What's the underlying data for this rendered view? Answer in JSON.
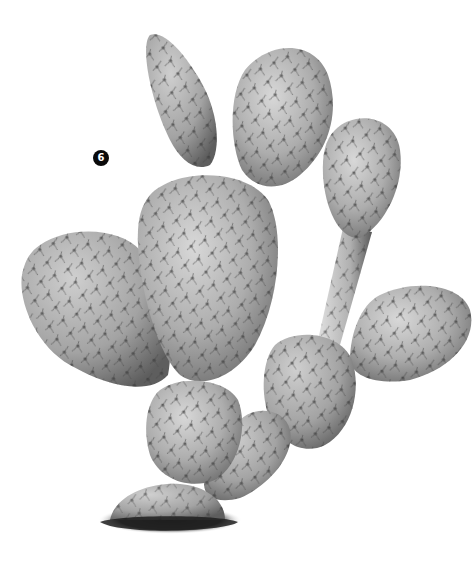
{
  "image": {
    "subject": "prickly pear cactus",
    "style": "grayscale botanical illustration",
    "background_color": "#ffffff"
  },
  "marker": {
    "label": "6",
    "color": "#0a0a0a",
    "text_color": "#ffffff"
  },
  "pads": [
    {
      "name": "top-left-narrow-pad"
    },
    {
      "name": "top-right-pad"
    },
    {
      "name": "central-large-pad"
    },
    {
      "name": "left-pad"
    },
    {
      "name": "right-upper-pad"
    },
    {
      "name": "right-stem"
    },
    {
      "name": "right-lower-pad"
    },
    {
      "name": "middle-right-pad"
    },
    {
      "name": "lower-center-pad"
    },
    {
      "name": "lower-small-pad"
    },
    {
      "name": "base-pad"
    }
  ],
  "colors": {
    "pad_light": "#d4d4d4",
    "pad_mid": "#a9a9a9",
    "pad_dark": "#6e6e6e",
    "areole": "#2a2a2a",
    "ground": "#1e1e1e"
  }
}
